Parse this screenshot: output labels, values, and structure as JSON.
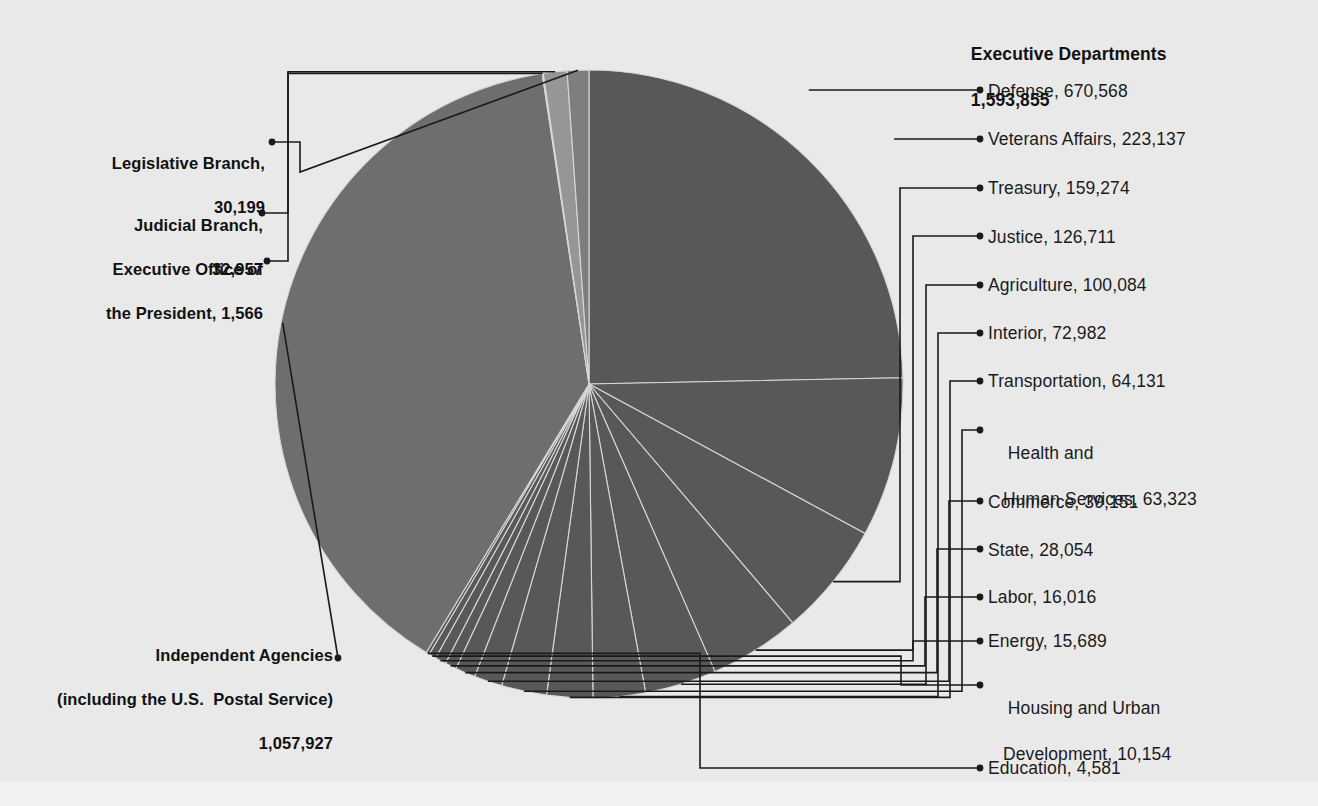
{
  "chart_data": {
    "type": "pie",
    "title": "Executive Departments",
    "total_label": "1,593,855",
    "grand_total": 2716504,
    "units": "employees",
    "legend_position": "callout-leader-lines",
    "categories": [
      "Defense",
      "Veterans Affairs",
      "Treasury",
      "Justice",
      "Agriculture",
      "Interior",
      "Transportation",
      "Health and Human Services",
      "Commerce",
      "State",
      "Labor",
      "Energy",
      "Housing and Urban Development",
      "Education",
      "Judicial Branch",
      "Legislative Branch",
      "Executive Office of the President",
      "Independent Agencies (including the U.S.  Postal Service)"
    ],
    "values": [
      670568,
      223137,
      159274,
      126711,
      100084,
      72982,
      64131,
      63323,
      39151,
      28054,
      16016,
      15689,
      10154,
      4581,
      32957,
      30199,
      1566,
      1057927
    ],
    "series": [
      {
        "name": "Federal civilian employment",
        "values": [
          670568,
          223137,
          159274,
          126711,
          100084,
          72982,
          64131,
          63323,
          39151,
          28054,
          16016,
          15689,
          10154,
          4581,
          32957,
          30199,
          1566,
          1057927
        ]
      }
    ],
    "group_totals": {
      "Executive Departments": 1593855,
      "Independent Agencies": 1057927,
      "Judicial Branch": 32957,
      "Legislative Branch": 30199,
      "Executive Office of the President": 1566
    },
    "colors": {
      "executive_departments": "#585858",
      "independent_agencies": "#6e6e6e",
      "legislative_branch": "#7e7e7e",
      "judicial_branch": "#969696",
      "executive_office": "#b4b4b4",
      "background": "#e9e9e9",
      "leader_line": "#1a1a1a",
      "wedge_divider": "#d8d8d8"
    }
  },
  "header": {
    "group_title": "Executive Departments",
    "group_total": "1,593,855"
  },
  "right_labels": [
    {
      "id": "defense",
      "text": "Defense, 670,568"
    },
    {
      "id": "veterans",
      "text": "Veterans Affairs, 223,137"
    },
    {
      "id": "treasury",
      "text": "Treasury, 159,274"
    },
    {
      "id": "justice",
      "text": "Justice, 126,711"
    },
    {
      "id": "agriculture",
      "text": "Agriculture, 100,084"
    },
    {
      "id": "interior",
      "text": "Interior, 72,982"
    },
    {
      "id": "transportation",
      "text": "Transportation, 64,131"
    },
    {
      "id": "hhs-line1",
      "text": "Health and"
    },
    {
      "id": "hhs-line2",
      "text": "Human Services, 63,323"
    },
    {
      "id": "commerce",
      "text": "Commerce, 39,151"
    },
    {
      "id": "state",
      "text": "State, 28,054"
    },
    {
      "id": "labor",
      "text": "Labor, 16,016"
    },
    {
      "id": "energy",
      "text": "Energy, 15,689"
    },
    {
      "id": "hud-line1",
      "text": "Housing and Urban"
    },
    {
      "id": "hud-line2",
      "text": "Development, 10,154"
    },
    {
      "id": "education",
      "text": "Education, 4,581"
    }
  ],
  "left_labels": {
    "legislative_line1": "Legislative Branch,",
    "legislative_line2": "30,199",
    "judicial_line1": "Judicial Branch,",
    "judicial_line2": "32,957",
    "eop_line1": "Executive Office of",
    "eop_line2": "the President, 1,566",
    "independent_line1": "Independent Agencies",
    "independent_line2": "(including the U.S.  Postal Service)",
    "independent_line3": "1,057,927"
  }
}
